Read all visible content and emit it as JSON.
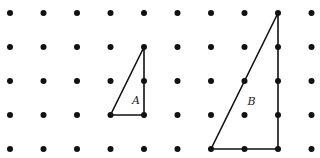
{
  "grid": {
    "columns": 10,
    "rows": 5,
    "x_positions": [
      10,
      43.5,
      77,
      110.5,
      144,
      177.5,
      211,
      244.5,
      278,
      311.5
    ],
    "y_positions": [
      13,
      47,
      81,
      115,
      149
    ],
    "dot_color": "#111111",
    "dot_radius": 3
  },
  "shapes": [
    {
      "name": "A",
      "label": "A",
      "type": "right-triangle",
      "vertices_grid": [
        [
          3,
          3
        ],
        [
          4,
          1
        ],
        [
          4,
          3
        ]
      ],
      "label_pos": [
        4,
        2.55
      ]
    },
    {
      "name": "B",
      "label": "B",
      "type": "right-triangle",
      "vertices_grid": [
        [
          6,
          4
        ],
        [
          8,
          0
        ],
        [
          8,
          4
        ]
      ],
      "label_pos": [
        7.45,
        2.6
      ]
    }
  ],
  "line_color": "#111111"
}
